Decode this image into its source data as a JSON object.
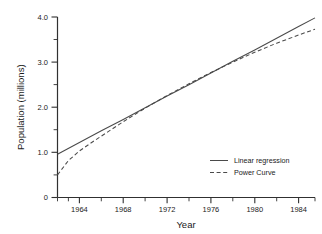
{
  "chart_data": {
    "type": "line",
    "title": "",
    "xlabel": "Year",
    "ylabel": "Population (millions)",
    "xlim": [
      1962,
      1985.5
    ],
    "ylim": [
      0,
      4.0
    ],
    "grid": false,
    "legend_position": "bottom-right-inside",
    "x_ticks": [
      1964,
      1968,
      1972,
      1976,
      1980,
      1984
    ],
    "x_tick_labels": [
      "1964",
      "1968",
      "1972",
      "1976",
      "1980",
      "1984"
    ],
    "x_minor_step": 2,
    "y_ticks": [
      0,
      1.0,
      2.0,
      3.0,
      4.0
    ],
    "y_tick_labels": [
      "0",
      "1.0",
      "2.0",
      "3.0",
      "4.0"
    ],
    "y_minor_step": 0.5,
    "series": [
      {
        "name": "Linear regression",
        "style": "solid",
        "color": "#4a4a4a",
        "x": [
          1962,
          1964,
          1966,
          1968,
          1970,
          1972,
          1974,
          1976,
          1978,
          1980,
          1982,
          1984,
          1985.5
        ],
        "values": [
          0.96,
          1.22,
          1.48,
          1.73,
          1.99,
          2.25,
          2.5,
          2.76,
          3.02,
          3.27,
          3.53,
          3.79,
          3.98
        ]
      },
      {
        "name": "Power Curve",
        "style": "dashed",
        "color": "#4a4a4a",
        "x": [
          1962,
          1963,
          1964,
          1965,
          1966,
          1968,
          1970,
          1972,
          1974,
          1976,
          1978,
          1980,
          1982,
          1984,
          1985.5
        ],
        "values": [
          0.5,
          0.82,
          1.03,
          1.2,
          1.36,
          1.68,
          1.98,
          2.26,
          2.52,
          2.77,
          3.0,
          3.22,
          3.42,
          3.6,
          3.73
        ]
      }
    ]
  },
  "axes": {
    "x_title": "Year",
    "y_title": "Population (millions)"
  },
  "legend": {
    "entries": [
      {
        "label": "Linear regression",
        "style": "solid"
      },
      {
        "label": "Power Curve",
        "style": "dashed"
      }
    ]
  },
  "ticks": {
    "x": [
      "1964",
      "1968",
      "1972",
      "1976",
      "1980",
      "1984"
    ],
    "y": [
      "4.0",
      "3.0",
      "2.0",
      "1.0",
      "0"
    ]
  }
}
